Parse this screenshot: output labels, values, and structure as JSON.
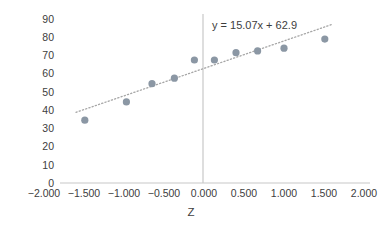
{
  "chart_data": {
    "type": "scatter",
    "title": "",
    "xlabel": "Z",
    "ylabel": "Time to failure",
    "xlim": [
      -2.0,
      2.0
    ],
    "ylim": [
      0,
      90
    ],
    "grid": false,
    "legend": "none",
    "x_tick_labels": [
      "-2.000",
      "-1.500",
      "-1.000",
      "-0.500",
      "0.000",
      "0.500",
      "1.000",
      "1.500",
      "2.000"
    ],
    "x_tick_values": [
      -2.0,
      -1.5,
      -1.0,
      -0.5,
      0.0,
      0.5,
      1.0,
      1.5,
      2.0
    ],
    "y_tick_labels": [
      "90",
      "80",
      "70",
      "60",
      "50",
      "40",
      "30",
      "20",
      "10",
      "0"
    ],
    "y_tick_values": [
      90,
      80,
      70,
      60,
      50,
      40,
      30,
      20,
      10,
      0
    ],
    "series": [
      {
        "name": "Time to failure",
        "marker": "circle",
        "color": "#8b97a4",
        "x": [
          -1.49,
          -0.97,
          -0.65,
          -0.37,
          -0.12,
          0.13,
          0.4,
          0.67,
          1.0,
          1.51
        ],
        "y": [
          34.5,
          44.5,
          54.5,
          57.5,
          67.5,
          67.5,
          71.5,
          72.5,
          74.0,
          79.0
        ]
      }
    ],
    "trendline": {
      "type": "linear",
      "equation": "y = 15.07x + 62.9",
      "slope": 15.07,
      "intercept": 62.9,
      "style": "dotted",
      "color": "#a6a6a6",
      "x_start": -1.6,
      "x_end": 1.6
    },
    "annotations": [
      {
        "name": "trendline-equation",
        "text": "y = 15.07x + 62.9",
        "x": 0.1,
        "y": 86
      }
    ],
    "axis_color": "#c8c8c8",
    "text_color": "#404040",
    "background": "#ffffff"
  }
}
